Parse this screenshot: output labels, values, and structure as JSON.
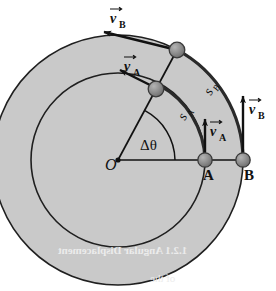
{
  "figure": {
    "background_color": "#ffffff",
    "disk_fill": "#c8c8c8",
    "stroke_color": "#1a1a1a",
    "ball_fill": "#8c8c8c"
  },
  "labels": {
    "origin": "O",
    "point_a": "A",
    "point_b": "B",
    "delta_theta": "Δθ",
    "arc_a": "s",
    "arc_a_sub": "A",
    "arc_b": "s",
    "arc_b_sub": "B",
    "v_a": "v",
    "v_a_sub": "A",
    "v_b": "v",
    "v_b_sub": "B",
    "vector_hat": "→"
  },
  "vectors": [
    {
      "name": "v_A_initial",
      "label": "v",
      "subscript": "A",
      "at_point": "A",
      "direction": "tangential-up",
      "length_px": 40
    },
    {
      "name": "v_B_initial",
      "label": "v",
      "subscript": "B",
      "at_point": "B",
      "direction": "tangential-up",
      "length_px": 63
    },
    {
      "name": "v_A_rotated",
      "label": "v",
      "subscript": "A",
      "at_point": "A-prime",
      "direction": "tangential",
      "length_px": 40
    },
    {
      "name": "v_B_rotated",
      "label": "v",
      "subscript": "B",
      "at_point": "B-prime",
      "direction": "tangential",
      "length_px": 63
    }
  ],
  "geometry": {
    "origin_x": 118,
    "origin_y": 160,
    "inner_radius": 87,
    "outer_radius": 125,
    "angle_deg": 62,
    "point_a_x": 205,
    "point_a_y": 160,
    "point_b_x": 243,
    "point_b_y": 160
  },
  "bleed_text": {
    "line1": "1.2.1 Angular Displacement",
    "line2": "of the",
    "line3": "a"
  }
}
